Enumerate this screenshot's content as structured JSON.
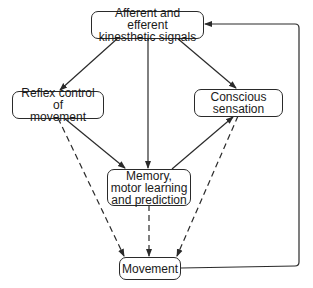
{
  "diagram": {
    "nodes": {
      "signals": {
        "label": "Afferent and efferent\nkinesthetic signals"
      },
      "reflex": {
        "label": "Reflex control of\nmovement"
      },
      "conscious": {
        "label": "Conscious\nsensation"
      },
      "memory": {
        "label": "Memory,\nmotor learning\nand prediction"
      },
      "movement": {
        "label": "Movement"
      }
    },
    "edges": [
      {
        "from": "signals",
        "to": "reflex",
        "style": "solid"
      },
      {
        "from": "signals",
        "to": "memory",
        "style": "solid"
      },
      {
        "from": "signals",
        "to": "conscious",
        "style": "solid"
      },
      {
        "from": "reflex",
        "to": "memory",
        "style": "solid"
      },
      {
        "from": "memory",
        "to": "conscious",
        "style": "solid"
      },
      {
        "from": "reflex",
        "to": "movement",
        "style": "dashed"
      },
      {
        "from": "memory",
        "to": "movement",
        "style": "dashed"
      },
      {
        "from": "conscious",
        "to": "movement",
        "style": "dashed"
      },
      {
        "from": "movement",
        "to": "signals",
        "style": "solid",
        "route": "feedback-loop-right"
      }
    ],
    "colors": {
      "stroke": "#2a2a2a",
      "background": "#ffffff"
    }
  }
}
